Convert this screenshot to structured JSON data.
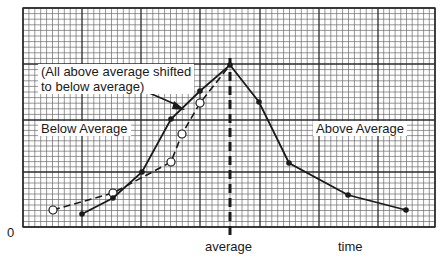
{
  "chart_data": {
    "type": "line",
    "title": "",
    "xlabel": "time",
    "ylabel": "",
    "origin_label": "0",
    "x_marker": {
      "label": "average",
      "x": 230
    },
    "grid": true,
    "plot_area": {
      "x0": 23,
      "y0": 8,
      "x1": 435,
      "y1": 227
    },
    "major_x": [
      23,
      82,
      141,
      200,
      260,
      319,
      378,
      435
    ],
    "major_y": [
      8,
      64,
      120,
      172,
      227
    ],
    "minor_step": 5.9,
    "series": [
      {
        "name": "Original distribution",
        "style": "solid",
        "marker": "filled-circle",
        "points_px": [
          [
            82,
            214
          ],
          [
            113,
            198
          ],
          [
            142,
            172
          ],
          [
            171,
            119
          ],
          [
            200,
            91
          ],
          [
            230,
            65
          ],
          [
            259,
            102
          ],
          [
            289,
            163
          ],
          [
            348,
            195
          ],
          [
            406,
            210
          ]
        ]
      },
      {
        "name": "All above average shifted to below average",
        "style": "dashed",
        "marker": "open-circle",
        "points_px": [
          [
            53,
            210
          ],
          [
            113,
            193
          ],
          [
            171,
            162
          ],
          [
            182,
            134
          ],
          [
            200,
            103
          ],
          [
            230,
            65
          ]
        ]
      }
    ],
    "annotations": [
      {
        "text_line1": "(All above average shifted",
        "text_line2": "to below average)",
        "arrow_to": [
          182,
          108
        ]
      },
      {
        "text": "Below Average"
      },
      {
        "text": "Above Average"
      }
    ]
  },
  "labels": {
    "annotation_line1": "(All above average shifted",
    "annotation_line2": "to below average)",
    "below": "Below Average",
    "above": "Above Average",
    "zero": "0",
    "average": "average",
    "time": "time"
  },
  "colors": {
    "grid_minor": "#6a6a6a",
    "grid_major": "#2a2a2a",
    "line": "#1a1a1a",
    "background": "#ffffff"
  }
}
